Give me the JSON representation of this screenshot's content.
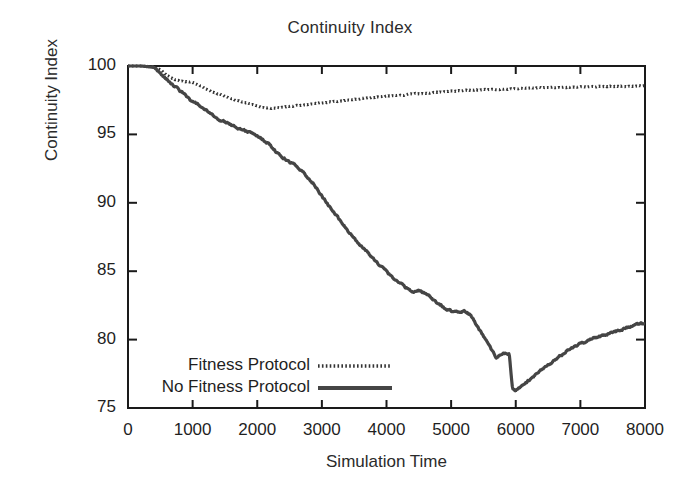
{
  "chart_data": {
    "type": "line",
    "title": "Continuity Index",
    "xlabel": "Simulation Time",
    "ylabel": "Continuity Index",
    "xlim": [
      0,
      8000
    ],
    "ylim": [
      75,
      100
    ],
    "xticks": [
      0,
      1000,
      2000,
      3000,
      4000,
      5000,
      6000,
      7000,
      8000
    ],
    "xtick_labels": [
      "0",
      "1000",
      "2000",
      "3000",
      "4000",
      "5000",
      "6000",
      "7000",
      "8000"
    ],
    "yticks": [
      75,
      80,
      85,
      90,
      95,
      100
    ],
    "ytick_labels": [
      "75",
      "80",
      "85",
      "90",
      "95",
      "100"
    ],
    "grid": false,
    "legend_position": "lower-left-inside",
    "series": [
      {
        "name": "Fitness Protocol",
        "style": "dotted",
        "color": "#333333",
        "x": [
          0,
          200,
          400,
          500,
          600,
          700,
          800,
          900,
          1000,
          1100,
          1200,
          1300,
          1400,
          1500,
          1600,
          1700,
          1800,
          1900,
          2000,
          2100,
          2200,
          2300,
          2400,
          2500,
          2600,
          2800,
          3000,
          3200,
          3400,
          3600,
          3800,
          4000,
          4200,
          4400,
          4600,
          4800,
          5000,
          5200,
          5400,
          5600,
          5800,
          6000,
          6200,
          6400,
          6600,
          6800,
          7000,
          7200,
          7400,
          7600,
          7800,
          8000
        ],
        "y": [
          100.0,
          100.0,
          99.95,
          99.7,
          99.3,
          99.05,
          98.9,
          98.85,
          98.8,
          98.6,
          98.35,
          98.1,
          97.95,
          97.8,
          97.6,
          97.45,
          97.35,
          97.2,
          97.05,
          96.95,
          96.9,
          96.95,
          97.0,
          97.05,
          97.1,
          97.2,
          97.3,
          97.4,
          97.5,
          97.6,
          97.7,
          97.78,
          97.85,
          97.95,
          98.0,
          98.08,
          98.15,
          98.2,
          98.25,
          98.3,
          98.32,
          98.35,
          98.38,
          98.4,
          98.42,
          98.45,
          98.46,
          98.48,
          98.5,
          98.52,
          98.53,
          98.55
        ]
      },
      {
        "name": "No Fitness Protocol",
        "style": "solid",
        "color": "#454545",
        "x": [
          0,
          200,
          400,
          500,
          600,
          700,
          800,
          900,
          1000,
          1100,
          1200,
          1300,
          1400,
          1500,
          1600,
          1700,
          1800,
          1900,
          2000,
          2100,
          2200,
          2300,
          2400,
          2500,
          2600,
          2700,
          2800,
          2900,
          3000,
          3100,
          3200,
          3300,
          3400,
          3500,
          3600,
          3700,
          3800,
          3900,
          4000,
          4100,
          4200,
          4300,
          4400,
          4500,
          4600,
          4700,
          4800,
          4900,
          5000,
          5100,
          5200,
          5300,
          5400,
          5500,
          5600,
          5700,
          5800,
          5900,
          5950,
          6000,
          6100,
          6200,
          6400,
          6600,
          6800,
          7000,
          7200,
          7400,
          7600,
          7800,
          8000
        ],
        "y": [
          100.0,
          100.0,
          99.9,
          99.5,
          99.0,
          98.6,
          98.2,
          97.8,
          97.4,
          97.1,
          96.8,
          96.4,
          96.1,
          95.9,
          95.7,
          95.5,
          95.3,
          95.1,
          94.9,
          94.6,
          94.2,
          93.7,
          93.3,
          93.0,
          92.7,
          92.3,
          91.8,
          91.2,
          90.5,
          89.8,
          89.2,
          88.6,
          88.0,
          87.4,
          86.9,
          86.4,
          85.9,
          85.4,
          85.0,
          84.5,
          84.2,
          83.8,
          83.5,
          83.6,
          83.4,
          83.0,
          82.6,
          82.3,
          82.1,
          82.0,
          82.1,
          81.8,
          81.0,
          80.2,
          79.4,
          78.7,
          79.0,
          78.9,
          76.4,
          76.3,
          76.6,
          77.0,
          77.8,
          78.5,
          79.2,
          79.7,
          80.1,
          80.4,
          80.7,
          81.0,
          81.2
        ]
      }
    ]
  },
  "legend": {
    "entries": [
      {
        "label": "Fitness Protocol",
        "style": "dotted"
      },
      {
        "label": "No Fitness Protocol",
        "style": "solid"
      }
    ]
  }
}
